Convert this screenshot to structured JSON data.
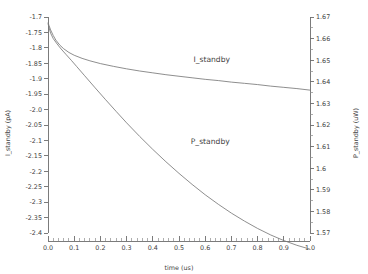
{
  "chart_data": {
    "type": "line",
    "title": "",
    "xlabel": "time (us)",
    "ylabel": "I_standby (pA)",
    "y2label": "P_standby (uW)",
    "grid": false,
    "legend_position": "inline-annotation",
    "xlim": [
      0.0,
      1.0
    ],
    "ylim": [
      -2.4,
      -1.7
    ],
    "y2lim": [
      1.57,
      1.67
    ],
    "xticks": [
      "0.0",
      "0.1",
      "0.2",
      "0.3",
      "0.4",
      "0.5",
      "0.6",
      "0.7",
      "0.8",
      "0.9",
      "1.0"
    ],
    "xtick_values": [
      0.0,
      0.1,
      0.2,
      0.3,
      0.4,
      0.5,
      0.6,
      0.7,
      0.8,
      0.9,
      1.0
    ],
    "yticks": [
      "-1.7",
      "-1.75",
      "-1.8",
      "-1.85",
      "-1.9",
      "-1.95",
      "-2.0",
      "-2.05",
      "-2.1",
      "-2.15",
      "-2.2",
      "-2.25",
      "-2.3",
      "-2.35",
      "-2.4"
    ],
    "ytick_values": [
      -1.7,
      -1.75,
      -1.8,
      -1.85,
      -1.9,
      -1.95,
      -2.0,
      -2.05,
      -2.1,
      -2.15,
      -2.2,
      -2.25,
      -2.3,
      -2.35,
      -2.4
    ],
    "y2ticks": [
      "1.67",
      "1.66",
      "1.65",
      "1.64",
      "1.63",
      "1.62",
      "1.61",
      "1.6",
      "1.59",
      "1.58",
      "1.57"
    ],
    "y2tick_values": [
      1.67,
      1.66,
      1.65,
      1.64,
      1.63,
      1.62,
      1.61,
      1.6,
      1.59,
      1.58,
      1.57
    ],
    "x_minor_per_major": 5,
    "series": [
      {
        "name": "I_standby",
        "axis": "left",
        "units": "pA",
        "label_x": 0.555,
        "label_y": -1.845,
        "x": [
          0.0,
          0.004,
          0.01,
          0.02,
          0.03,
          0.045,
          0.06,
          0.08,
          0.1,
          0.13,
          0.16,
          0.2,
          0.25,
          0.3,
          0.35,
          0.4,
          0.45,
          0.5,
          0.55,
          0.6,
          0.65,
          0.7,
          0.75,
          0.8,
          0.85,
          0.9,
          0.95,
          1.0
        ],
        "values": [
          -1.718,
          -1.728,
          -1.742,
          -1.76,
          -1.775,
          -1.791,
          -1.803,
          -1.815,
          -1.824,
          -1.834,
          -1.842,
          -1.851,
          -1.86,
          -1.868,
          -1.875,
          -1.881,
          -1.887,
          -1.892,
          -1.897,
          -1.902,
          -1.906,
          -1.911,
          -1.915,
          -1.919,
          -1.924,
          -1.928,
          -1.932,
          -1.937
        ]
      },
      {
        "name": "P_standby",
        "axis": "right",
        "units": "uW",
        "label_x": 0.545,
        "label_y": 1.611,
        "x": [
          0.0,
          0.004,
          0.01,
          0.02,
          0.035,
          0.05,
          0.07,
          0.09,
          0.11,
          0.14,
          0.18,
          0.22,
          0.26,
          0.3,
          0.35,
          0.4,
          0.45,
          0.5,
          0.55,
          0.6,
          0.65,
          0.7,
          0.75,
          0.8,
          0.85,
          0.9,
          0.95,
          1.0
        ],
        "values": [
          1.667,
          1.665,
          1.6625,
          1.66,
          1.6575,
          1.6552,
          1.6525,
          1.6498,
          1.647,
          1.6428,
          1.6372,
          1.6317,
          1.6263,
          1.621,
          1.6147,
          1.6087,
          1.603,
          1.5976,
          1.5925,
          1.5877,
          1.5833,
          1.5792,
          1.5755,
          1.5721,
          1.5691,
          1.5665,
          1.5643,
          1.5625
        ]
      }
    ]
  }
}
